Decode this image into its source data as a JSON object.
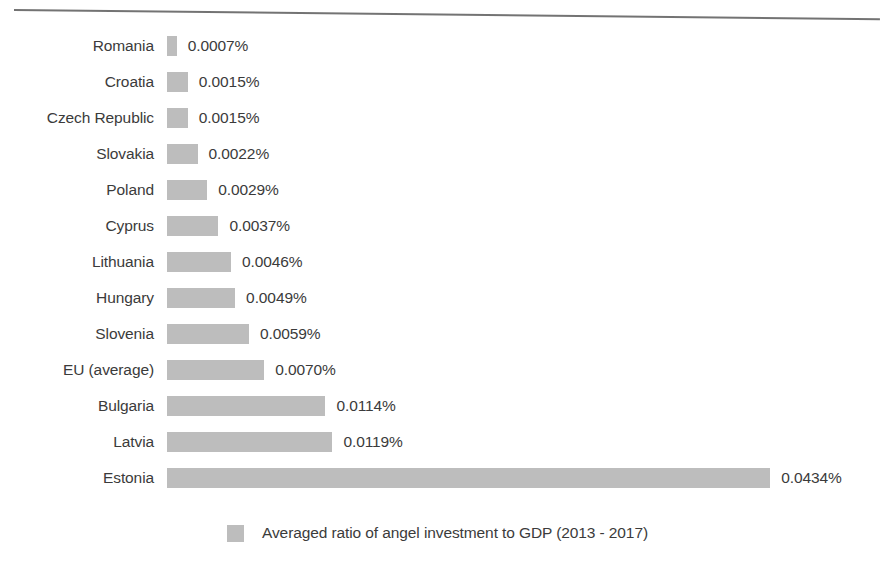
{
  "chart_data": {
    "type": "bar",
    "orientation": "horizontal",
    "title": "",
    "xlabel": "",
    "ylabel": "",
    "grid": false,
    "legend_position": "bottom",
    "value_suffix": "%",
    "xlim": [
      0,
      0.0434
    ],
    "px_per_unit": 13900,
    "categories": [
      "Romania",
      "Croatia",
      "Czech Republic",
      "Slovakia",
      "Poland",
      "Cyprus",
      "Lithuania",
      "Hungary",
      "Slovenia",
      "EU (average)",
      "Bulgaria",
      "Latvia",
      "Estonia"
    ],
    "values": [
      0.0007,
      0.0015,
      0.0015,
      0.0022,
      0.0029,
      0.0037,
      0.0046,
      0.0049,
      0.0059,
      0.007,
      0.0114,
      0.0119,
      0.0434
    ],
    "value_labels": [
      "0.0007%",
      "0.0015%",
      "0.0015%",
      "0.0022%",
      "0.0029%",
      "0.0037%",
      "0.0046%",
      "0.0049%",
      "0.0059%",
      "0.0070%",
      "0.0114%",
      "0.0119%",
      "0.0434%"
    ],
    "series": [
      {
        "name": "Averaged ratio of angel investment to GDP (2013 - 2017)",
        "color": "#bdbdbd",
        "values": [
          0.0007,
          0.0015,
          0.0015,
          0.0022,
          0.0029,
          0.0037,
          0.0046,
          0.0049,
          0.0059,
          0.007,
          0.0114,
          0.0119,
          0.0434
        ]
      }
    ]
  },
  "legend": {
    "label": "Averaged ratio of angel investment to GDP (2013 - 2017)",
    "swatch_color": "#bdbdbd"
  },
  "style": {
    "bar_color": "#bdbdbd",
    "text_color": "#3b3b3b",
    "background": "#ffffff",
    "rule_color": "#5a5a5a"
  }
}
